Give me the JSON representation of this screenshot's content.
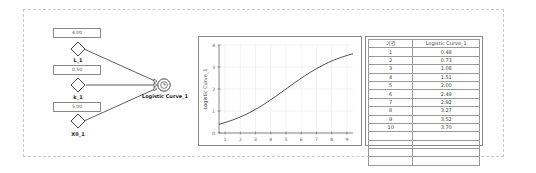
{
  "diagram": {
    "params": [
      {
        "name": "L_1",
        "value": "4.00"
      },
      {
        "name": "k_1",
        "value": "0.50"
      },
      {
        "name": "X0_1",
        "value": "5.00"
      }
    ],
    "output_node": {
      "name": "Logistic Curve_1",
      "icon": "clock-icon"
    }
  },
  "chart_data": {
    "type": "line",
    "title": "",
    "xlabel": "",
    "ylabel": "Logistic Curve_1",
    "x": [
      1,
      2,
      3,
      4,
      5,
      6,
      7,
      8,
      9,
      10
    ],
    "series": [
      {
        "name": "Logistic Curve_1",
        "values": [
          0.48,
          0.73,
          1.08,
          1.51,
          2.0,
          2.49,
          2.92,
          3.27,
          3.52,
          3.7
        ]
      }
    ],
    "xticks": [
      "1",
      "2",
      "3",
      "4",
      "5",
      "6",
      "7",
      "8",
      "9"
    ],
    "yticks": [
      "0",
      "1",
      "2",
      "3",
      "4"
    ],
    "xlim": [
      1,
      10
    ],
    "ylim": [
      0,
      4
    ],
    "grid": true
  },
  "table": {
    "headers": [
      "기간",
      "Logistic Curve_1"
    ],
    "rows": [
      [
        "1",
        "0.48"
      ],
      [
        "2",
        "0.73"
      ],
      [
        "3",
        "1.08"
      ],
      [
        "4",
        "1.51"
      ],
      [
        "5",
        "2.00"
      ],
      [
        "6",
        "2.49"
      ],
      [
        "7",
        "2.92"
      ],
      [
        "8",
        "3.27"
      ],
      [
        "9",
        "3.52"
      ],
      [
        "10",
        "3.70"
      ],
      [
        "",
        ""
      ],
      [
        "",
        ""
      ],
      [
        "",
        ""
      ],
      [
        "",
        ""
      ]
    ]
  }
}
